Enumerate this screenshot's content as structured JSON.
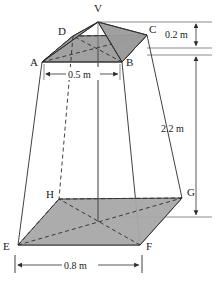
{
  "figure": {
    "kind": "geometry-diagram",
    "background_color": "#ffffff",
    "line_color": "#2b2b2b",
    "shade_color": "#a8a8a8",
    "vertices": [
      {
        "id": "V",
        "label": "V",
        "x": 98,
        "y": 22,
        "label_x": 94,
        "label_y": 12,
        "hidden": false
      },
      {
        "id": "A",
        "label": "A",
        "x": 42,
        "y": 62,
        "label_x": 30,
        "label_y": 66,
        "hidden": false
      },
      {
        "id": "B",
        "label": "B",
        "x": 122,
        "y": 62,
        "label_x": 126,
        "label_y": 66,
        "hidden": false
      },
      {
        "id": "C",
        "label": "C",
        "x": 147,
        "y": 35,
        "label_x": 149,
        "label_y": 33,
        "hidden": false
      },
      {
        "id": "D",
        "label": "D",
        "x": 73,
        "y": 36,
        "label_x": 58,
        "label_y": 35,
        "hidden": false
      },
      {
        "id": "E",
        "label": "E",
        "x": 18,
        "y": 245,
        "label_x": 3,
        "label_y": 250,
        "hidden": false
      },
      {
        "id": "F",
        "label": "F",
        "x": 140,
        "y": 245,
        "label_x": 146,
        "label_y": 250,
        "hidden": false
      },
      {
        "id": "G",
        "label": "G",
        "x": 182,
        "y": 198,
        "label_x": 187,
        "label_y": 196,
        "hidden": false
      },
      {
        "id": "H",
        "label": "H",
        "x": 59,
        "y": 199,
        "label_x": 46,
        "label_y": 198,
        "hidden": true
      }
    ],
    "dimensions": [
      {
        "id": "top-height",
        "value": "0.2 m",
        "orientation": "vertical",
        "label_x": 170,
        "label_y": 38,
        "from_y": 22,
        "to_y": 48,
        "axis_x": 196
      },
      {
        "id": "frustum-height",
        "value": "2.2 m",
        "orientation": "vertical",
        "label_x": 163,
        "label_y": 132,
        "from_y": 55,
        "to_y": 217,
        "axis_x": 196
      },
      {
        "id": "top-width",
        "value": "0.5 m",
        "orientation": "horizontal",
        "label_x": 82,
        "label_y": 77,
        "from_x": 45,
        "to_x": 119,
        "axis_y": 74
      },
      {
        "id": "base-width",
        "value": "0.8 m",
        "orientation": "horizontal",
        "label_x": 78,
        "label_y": 268,
        "from_x": 16,
        "to_x": 141,
        "axis_y": 265
      }
    ]
  }
}
